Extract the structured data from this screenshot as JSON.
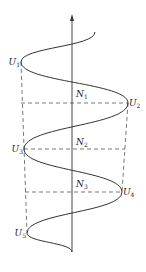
{
  "diagram": {
    "type": "wave-on-axis",
    "colors": {
      "stroke": "#333333",
      "dash": "#555555",
      "background": "#ffffff"
    },
    "axis": {
      "x": 72,
      "y_top": 14,
      "y_bottom": 252,
      "arrow": "up"
    },
    "curve_points": [
      [
        95,
        32
      ],
      [
        21,
        62
      ],
      [
        128,
        103
      ],
      [
        24,
        149
      ],
      [
        122,
        192
      ],
      [
        27,
        233
      ],
      [
        72,
        252
      ]
    ],
    "peaks": [
      {
        "id": "U1",
        "base": "U",
        "sub": "1",
        "x": 21,
        "y": 62,
        "side": "left"
      },
      {
        "id": "U2",
        "base": "U",
        "sub": "2",
        "x": 128,
        "y": 103,
        "side": "right"
      },
      {
        "id": "U3",
        "base": "U",
        "sub": "3",
        "x": 24,
        "y": 149,
        "side": "left"
      },
      {
        "id": "U4",
        "base": "U",
        "sub": "4",
        "x": 122,
        "y": 192,
        "side": "right"
      },
      {
        "id": "U5",
        "base": "U",
        "sub": "5",
        "x": 27,
        "y": 233,
        "side": "left"
      }
    ],
    "nodes": [
      {
        "id": "N1",
        "base": "N",
        "sub": "1",
        "x": 76,
        "y": 97
      },
      {
        "id": "N2",
        "base": "N",
        "sub": "2",
        "x": 76,
        "y": 145
      },
      {
        "id": "N3",
        "base": "N",
        "sub": "3",
        "x": 76,
        "y": 187
      }
    ],
    "dashed_horizontal": [
      {
        "y": 103,
        "x1": 21,
        "x2": 128
      },
      {
        "y": 149,
        "x1": 24,
        "x2": 125
      },
      {
        "y": 192,
        "x1": 25,
        "x2": 122
      }
    ],
    "dashed_vertical": [
      {
        "x1": 21,
        "y1": 62,
        "x2": 27,
        "y2": 233
      },
      {
        "x1": 128,
        "y1": 103,
        "x2": 122,
        "y2": 192
      }
    ]
  }
}
